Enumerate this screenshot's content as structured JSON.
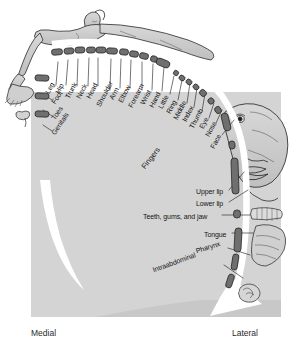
{
  "figure": {
    "axis": {
      "medial_label": "Medial",
      "lateral_label": "Lateral"
    },
    "group_labels": [
      {
        "text": "Fingers",
        "x": 143,
        "y": 168,
        "rotate": -52
      }
    ],
    "colors": {
      "background": "#ffffff",
      "panel_gray": "#d4d4d4",
      "cortex_strip": "#6f6f6f",
      "cortex_strip_dark": "#4a4a4a",
      "body_fill": "#c9c9c9",
      "outline": "#1a1a1a",
      "text": "#141414"
    },
    "labels": [
      {
        "text": "Leg",
        "x": 47,
        "y": 93,
        "rotate": -62,
        "leader": [
          [
            56,
            85
          ],
          [
            58,
            62
          ]
        ]
      },
      {
        "text": "Hip",
        "x": 57,
        "y": 93,
        "rotate": -62,
        "leader": [
          [
            66,
            85
          ],
          [
            68,
            60
          ]
        ]
      },
      {
        "text": "Trunk",
        "x": 67,
        "y": 98,
        "rotate": -62,
        "leader": [
          [
            77,
            86
          ],
          [
            78,
            59
          ]
        ]
      },
      {
        "text": "Neck",
        "x": 78,
        "y": 98,
        "rotate": -62,
        "leader": [
          [
            88,
            86
          ],
          [
            89,
            58
          ]
        ]
      },
      {
        "text": "Head",
        "x": 88,
        "y": 98,
        "rotate": -62,
        "leader": [
          [
            98,
            86
          ],
          [
            98,
            58
          ]
        ]
      },
      {
        "text": "Shoulder",
        "x": 98,
        "y": 106,
        "rotate": -62,
        "leader": [
          [
            110,
            90
          ],
          [
            111,
            59
          ]
        ]
      },
      {
        "text": "Arm",
        "x": 111,
        "y": 99,
        "rotate": -62,
        "leader": [
          [
            120,
            88
          ],
          [
            121,
            59
          ]
        ]
      },
      {
        "text": "Elbow",
        "x": 120,
        "y": 102,
        "rotate": -62,
        "leader": [
          [
            130,
            88
          ],
          [
            131,
            60
          ]
        ]
      },
      {
        "text": "Forearm",
        "x": 130,
        "y": 107,
        "rotate": -62,
        "leader": [
          [
            142,
            90
          ],
          [
            142,
            62
          ]
        ]
      },
      {
        "text": "Wrist",
        "x": 142,
        "y": 104,
        "rotate": -62,
        "leader": [
          [
            152,
            90
          ],
          [
            153,
            64
          ]
        ]
      },
      {
        "text": "Hand",
        "x": 151,
        "y": 107,
        "rotate": -62,
        "leader": [
          [
            162,
            91
          ],
          [
            164,
            67
          ]
        ]
      },
      {
        "text": "Little",
        "x": 160,
        "y": 108,
        "rotate": -62,
        "leader": [
          [
            170,
            94
          ],
          [
            174,
            76
          ]
        ]
      },
      {
        "text": "Ring",
        "x": 168,
        "y": 113,
        "rotate": -62,
        "leader": [
          [
            178,
            100
          ],
          [
            182,
            80
          ]
        ]
      },
      {
        "text": "Middle",
        "x": 175,
        "y": 119,
        "rotate": -62,
        "leader": [
          [
            187,
            103
          ],
          [
            190,
            83
          ]
        ]
      },
      {
        "text": "Index",
        "x": 184,
        "y": 121,
        "rotate": -62,
        "leader": [
          [
            194,
            107
          ],
          [
            197,
            88
          ]
        ]
      },
      {
        "text": "Thumb",
        "x": 191,
        "y": 128,
        "rotate": -62,
        "leader": [
          [
            202,
            111
          ],
          [
            205,
            94
          ]
        ]
      },
      {
        "text": "Eye",
        "x": 201,
        "y": 128,
        "rotate": -62,
        "leader": [
          [
            209,
            118
          ],
          [
            214,
            103
          ]
        ]
      },
      {
        "text": "Nose",
        "x": 207,
        "y": 136,
        "rotate": -62,
        "leader": [
          [
            216,
            123
          ],
          [
            222,
            110
          ]
        ]
      },
      {
        "text": "Face",
        "x": 212,
        "y": 148,
        "rotate": -62,
        "leader": [
          [
            222,
            135
          ],
          [
            234,
            120
          ]
        ]
      },
      {
        "text": "Upper lip",
        "x": 196,
        "y": 191,
        "rotate": 0,
        "leader": [
          [
            229,
            190
          ],
          [
            244,
            172
          ]
        ]
      },
      {
        "text": "Lower lip",
        "x": 196,
        "y": 203,
        "rotate": 0,
        "leader": [
          [
            229,
            202
          ],
          [
            248,
            190
          ]
        ]
      },
      {
        "text": "Teeth, gums, and jaw",
        "x": 143,
        "y": 216,
        "rotate": 0,
        "leader": [
          [
            222,
            215
          ],
          [
            250,
            215
          ]
        ]
      },
      {
        "text": "Tongue",
        "x": 204,
        "y": 234,
        "rotate": 0,
        "leader": [
          [
            232,
            233
          ],
          [
            253,
            233
          ]
        ]
      },
      {
        "text": "Pharynx",
        "x": 196,
        "y": 251,
        "rotate": -18,
        "leader": [
          [
            228,
            248
          ],
          [
            250,
            255
          ]
        ]
      },
      {
        "text": "Intraabdominal",
        "x": 153,
        "y": 270,
        "rotate": -20,
        "leader": [
          [
            224,
            265
          ],
          [
            243,
            278
          ]
        ]
      },
      {
        "text": "Foot",
        "x": 53,
        "y": 103,
        "rotate": -56,
        "leader": [
          [
            52,
            100
          ],
          [
            43,
            94
          ]
        ]
      },
      {
        "text": "Toes",
        "x": 53,
        "y": 119,
        "rotate": -56,
        "leader": [
          [
            52,
            116
          ],
          [
            43,
            110
          ]
        ]
      },
      {
        "text": "Genitals",
        "x": 53,
        "y": 134,
        "rotate": -56,
        "leader": [
          [
            52,
            131
          ],
          [
            43,
            125
          ]
        ]
      }
    ],
    "cortex_segments": [
      {
        "name": "leg",
        "x": 57,
        "y": 52,
        "w": 11,
        "h": 6,
        "rot": -5
      },
      {
        "name": "hip",
        "x": 69,
        "y": 51,
        "w": 10,
        "h": 6,
        "rot": -4
      },
      {
        "name": "trunk",
        "x": 80,
        "y": 50,
        "w": 10,
        "h": 6,
        "rot": -3
      },
      {
        "name": "neck",
        "x": 91,
        "y": 50,
        "w": 9,
        "h": 6,
        "rot": -2
      },
      {
        "name": "head",
        "x": 101,
        "y": 50,
        "w": 10,
        "h": 6,
        "rot": 0
      },
      {
        "name": "shoulder",
        "x": 112,
        "y": 51,
        "w": 11,
        "h": 6,
        "rot": 3
      },
      {
        "name": "arm",
        "x": 124,
        "y": 52,
        "w": 9,
        "h": 6,
        "rot": 5
      },
      {
        "name": "elbow",
        "x": 134,
        "y": 54,
        "w": 9,
        "h": 6,
        "rot": 8
      },
      {
        "name": "forearm",
        "x": 144,
        "y": 56,
        "w": 9,
        "h": 6,
        "rot": 12
      },
      {
        "name": "wrist",
        "x": 154,
        "y": 59,
        "w": 7,
        "h": 6,
        "rot": 16
      },
      {
        "name": "hand",
        "x": 163,
        "y": 63,
        "w": 14,
        "h": 7,
        "rot": 22
      },
      {
        "name": "little",
        "x": 176,
        "y": 73,
        "w": 5,
        "h": 5,
        "rot": 30
      },
      {
        "name": "ring",
        "x": 182,
        "y": 78,
        "w": 6,
        "h": 5,
        "rot": 33
      },
      {
        "name": "middle",
        "x": 189,
        "y": 82,
        "w": 6,
        "h": 5,
        "rot": 36
      },
      {
        "name": "index",
        "x": 196,
        "y": 87,
        "w": 6,
        "h": 5,
        "rot": 40
      },
      {
        "name": "thumb",
        "x": 203,
        "y": 93,
        "w": 7,
        "h": 6,
        "rot": 45
      },
      {
        "name": "eye",
        "x": 211,
        "y": 101,
        "w": 6,
        "h": 6,
        "rot": 52
      },
      {
        "name": "nose",
        "x": 218,
        "y": 110,
        "w": 7,
        "h": 6,
        "rot": 58
      },
      {
        "name": "face",
        "x": 226,
        "y": 122,
        "w": 18,
        "h": 7,
        "rot": 76
      },
      {
        "name": "upper-lip",
        "x": 232,
        "y": 145,
        "w": 8,
        "h": 6,
        "rot": 84
      },
      {
        "name": "lower-lip",
        "x": 235,
        "y": 176,
        "w": 36,
        "h": 7,
        "rot": 88
      },
      {
        "name": "teeth-gums-jaw",
        "x": 237,
        "y": 214,
        "w": 8,
        "h": 7,
        "rot": 90
      },
      {
        "name": "tongue",
        "x": 238,
        "y": 240,
        "w": 24,
        "h": 7,
        "rot": 93
      },
      {
        "name": "pharynx",
        "x": 235,
        "y": 262,
        "w": 16,
        "h": 6,
        "rot": 99
      },
      {
        "name": "intraabdominal",
        "x": 230,
        "y": 281,
        "w": 14,
        "h": 6,
        "rot": 108
      },
      {
        "name": "foot",
        "x": 42,
        "y": 78,
        "w": 6,
        "h": 14,
        "rot": 92
      },
      {
        "name": "toes",
        "x": 42,
        "y": 96,
        "w": 6,
        "h": 14,
        "rot": 92
      },
      {
        "name": "genitals",
        "x": 42,
        "y": 114,
        "w": 6,
        "h": 14,
        "rot": 92
      }
    ]
  }
}
